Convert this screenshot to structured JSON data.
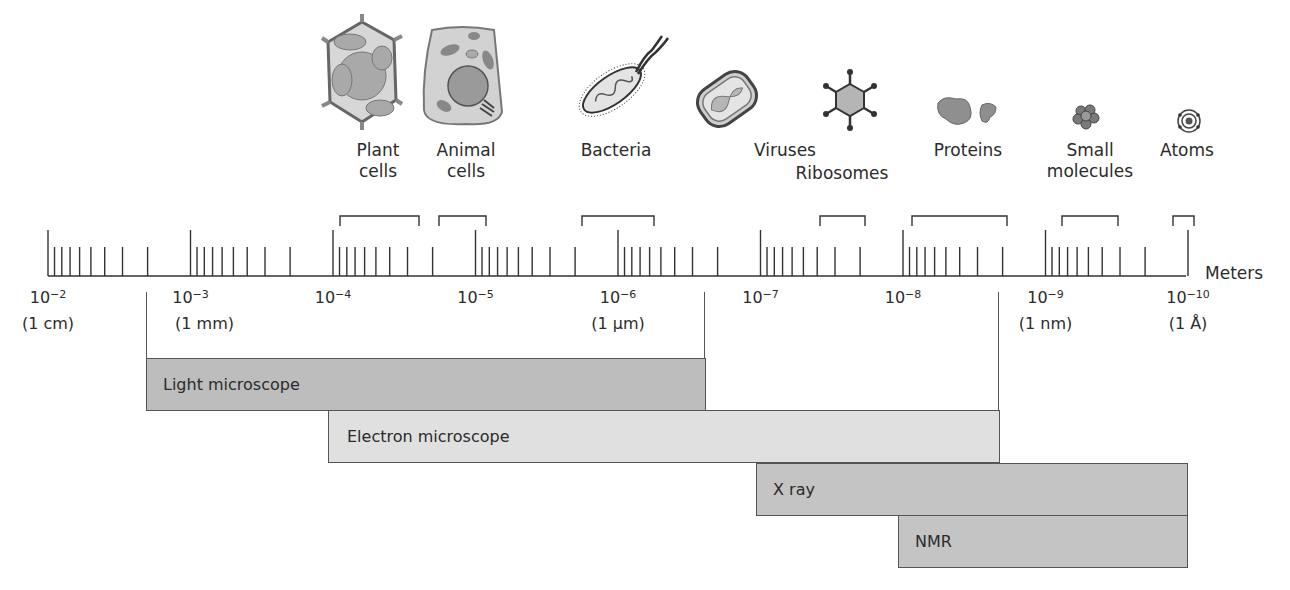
{
  "axis": {
    "unit_label": "Meters",
    "x_start_px": 48,
    "decade_px": 142.5,
    "ticks": [
      {
        "exp": "−2",
        "sub": "(1 cm)"
      },
      {
        "exp": "−3",
        "sub": "(1 mm)"
      },
      {
        "exp": "−4",
        "sub": ""
      },
      {
        "exp": "−5",
        "sub": ""
      },
      {
        "exp": "−6",
        "sub": "(1 µm)"
      },
      {
        "exp": "−7",
        "sub": ""
      },
      {
        "exp": "−8",
        "sub": ""
      },
      {
        "exp": "−9",
        "sub": "(1 nm)"
      },
      {
        "exp": "−10",
        "sub": "(1 Å)"
      }
    ],
    "tick_base": "10"
  },
  "objects": [
    {
      "name": "Plant cells",
      "line1": "Plant",
      "line2": "cells",
      "icon": "plant-cell-icon",
      "range_m": [
        0.0001,
        0.0004
      ]
    },
    {
      "name": "Animal cells",
      "line1": "Animal",
      "line2": "cells",
      "icon": "animal-cell-icon",
      "range_m": [
        2e-05,
        7e-05
      ]
    },
    {
      "name": "Bacteria",
      "line1": "Bacteria",
      "line2": "",
      "icon": "bacterium-icon",
      "range_m": [
        5e-07,
        5e-06
      ]
    },
    {
      "name": "Viruses",
      "line1": "Viruses",
      "line2": "",
      "icon": "virus-icon",
      "range_m": [
        2e-08,
        2.5e-07
      ]
    },
    {
      "name": "Ribosomes",
      "line1": "Ribosomes",
      "line2": "",
      "icon": "ribosome-icon",
      "range_m": [
        2e-08,
        3e-08
      ]
    },
    {
      "name": "Proteins",
      "line1": "Proteins",
      "line2": "",
      "icon": "protein-icon",
      "range_m": [
        2e-09,
        1e-08
      ]
    },
    {
      "name": "Small molecules",
      "line1": "Small",
      "line2": "molecules",
      "icon": "small-molecule-icon",
      "range_m": [
        3e-10,
        1e-09
      ]
    },
    {
      "name": "Atoms",
      "line1": "Atoms",
      "line2": "",
      "icon": "atom-icon",
      "range_m": [
        1e-10,
        1.5e-10
      ]
    }
  ],
  "techniques": [
    {
      "name": "Light microscope",
      "fill": "#bdbdbd",
      "from_m": "≈3×10⁻³",
      "to_m": "≈2×10⁻⁷"
    },
    {
      "name": "Electron microscope",
      "fill": "#e0e0e0",
      "from_m": "10⁻⁴",
      "to_m": "≈2×10⁻⁹"
    },
    {
      "name": "X ray",
      "fill": "#c4c4c4",
      "from_m": "10⁻⁷",
      "to_m": "10⁻¹⁰"
    },
    {
      "name": "NMR",
      "fill": "#c4c4c4",
      "from_m": "10⁻⁸",
      "to_m": "10⁻¹⁰"
    }
  ],
  "chart_data": {
    "type": "bar",
    "title": "",
    "xlabel": "Meters",
    "x_scale": "log (decreasing)",
    "x_ticks": [
      "10^-2 (1 cm)",
      "10^-3 (1 mm)",
      "10^-4",
      "10^-5",
      "10^-6 (1 µm)",
      "10^-7",
      "10^-8",
      "10^-9 (1 nm)",
      "10^-10 (1 Å)"
    ],
    "categories": [
      "Light microscope",
      "Electron microscope",
      "X ray",
      "NMR"
    ],
    "series": [
      {
        "name": "resolvable size range (m)",
        "values": [
          [
            0.003,
            2e-07
          ],
          [
            0.0001,
            2e-09
          ],
          [
            1e-07,
            1e-10
          ],
          [
            1e-08,
            1e-10
          ]
        ]
      }
    ],
    "annotations": [
      {
        "label": "Plant cells",
        "range": [
          0.0001,
          0.0004
        ]
      },
      {
        "label": "Animal cells",
        "range": [
          2e-05,
          7e-05
        ]
      },
      {
        "label": "Bacteria",
        "range": [
          5e-07,
          5e-06
        ]
      },
      {
        "label": "Viruses / Ribosomes",
        "range": [
          2e-08,
          7e-08
        ]
      },
      {
        "label": "Proteins",
        "range": [
          2e-09,
          1e-08
        ]
      },
      {
        "label": "Small molecules",
        "range": [
          3e-10,
          1e-09
        ]
      },
      {
        "label": "Atoms",
        "range": [
          1e-10,
          1.5e-10
        ]
      }
    ]
  }
}
